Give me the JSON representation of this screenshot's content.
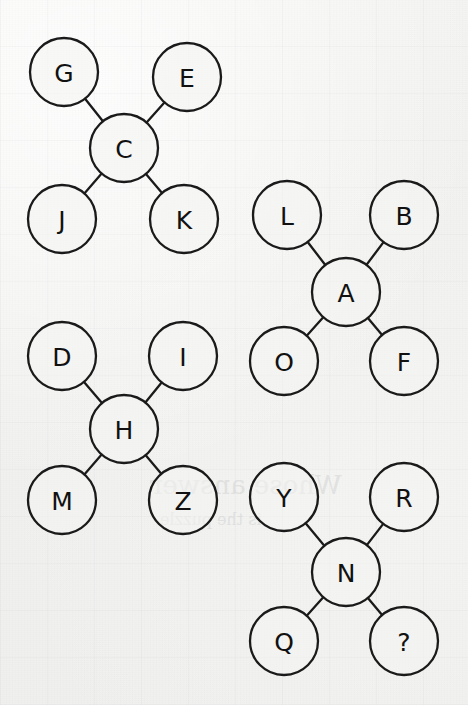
{
  "diagram": {
    "type": "node-link-clusters",
    "title": "",
    "background_color": "#f3f3f1",
    "node_fill": "#f4f4f2",
    "node_stroke": "#1a1a1a",
    "label_color": "#111111",
    "node_radius": 34,
    "clusters": [
      {
        "id": "cluster-c",
        "center": {
          "label": "C",
          "cx": 124,
          "cy": 148
        },
        "leaves": [
          {
            "label": "G",
            "cx": 64,
            "cy": 72,
            "position": "top-left"
          },
          {
            "label": "E",
            "cx": 187,
            "cy": 77,
            "position": "top-right"
          },
          {
            "label": "J",
            "cx": 62,
            "cy": 219,
            "position": "bottom-left"
          },
          {
            "label": "K",
            "cx": 184,
            "cy": 219,
            "position": "bottom-right"
          }
        ]
      },
      {
        "id": "cluster-a",
        "center": {
          "label": "A",
          "cx": 346,
          "cy": 292
        },
        "leaves": [
          {
            "label": "L",
            "cx": 287,
            "cy": 215,
            "position": "top-left"
          },
          {
            "label": "B",
            "cx": 404,
            "cy": 215,
            "position": "top-right"
          },
          {
            "label": "O",
            "cx": 284,
            "cy": 361,
            "position": "bottom-left"
          },
          {
            "label": "F",
            "cx": 404,
            "cy": 361,
            "position": "bottom-right"
          }
        ]
      },
      {
        "id": "cluster-h",
        "center": {
          "label": "H",
          "cx": 124,
          "cy": 429
        },
        "leaves": [
          {
            "label": "D",
            "cx": 62,
            "cy": 356,
            "position": "top-left"
          },
          {
            "label": "I",
            "cx": 183,
            "cy": 356,
            "position": "top-right"
          },
          {
            "label": "M",
            "cx": 62,
            "cy": 500,
            "position": "bottom-left"
          },
          {
            "label": "Z",
            "cx": 183,
            "cy": 500,
            "position": "bottom-right"
          }
        ]
      },
      {
        "id": "cluster-n",
        "center": {
          "label": "N",
          "cx": 346,
          "cy": 572
        },
        "leaves": [
          {
            "label": "Y",
            "cx": 284,
            "cy": 497,
            "position": "top-left"
          },
          {
            "label": "R",
            "cx": 404,
            "cy": 497,
            "position": "top-right"
          },
          {
            "label": "Q",
            "cx": 284,
            "cy": 641,
            "position": "bottom-left"
          },
          {
            "label": "?",
            "cx": 404,
            "cy": 641,
            "position": "bottom-right"
          }
        ]
      }
    ],
    "bleed_through": [
      {
        "text": "Whose answer",
        "x": 150,
        "y": 470,
        "size": 26
      },
      {
        "text": "is the puzzle",
        "x": 160,
        "y": 510,
        "size": 16
      }
    ]
  }
}
